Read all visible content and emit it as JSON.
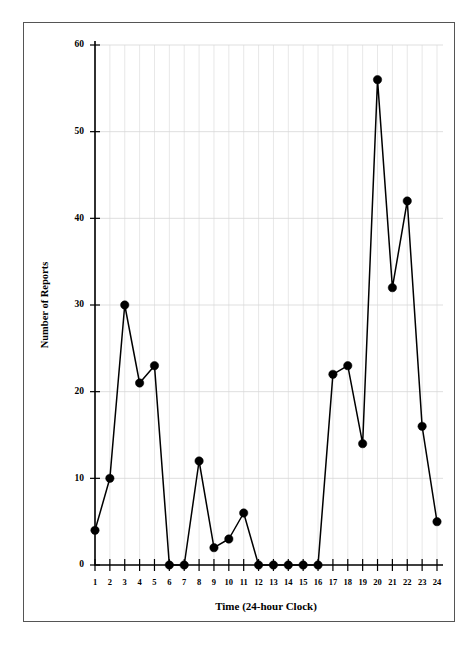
{
  "figure": {
    "background_color": "#ffffff",
    "frame_color": "#555555",
    "has_outer_frame": true
  },
  "chart_data": {
    "type": "line",
    "title": "",
    "subtitle": "",
    "xlabel": "Time (24-hour Clock)",
    "ylabel": "Number of Reports",
    "x": [
      1,
      2,
      3,
      4,
      5,
      6,
      7,
      8,
      9,
      10,
      11,
      12,
      13,
      14,
      15,
      16,
      17,
      18,
      19,
      20,
      21,
      22,
      23,
      24
    ],
    "values": [
      4,
      10,
      30,
      21,
      23,
      0,
      0,
      12,
      2,
      3,
      6,
      0,
      0,
      0,
      0,
      0,
      22,
      23,
      14,
      56,
      32,
      42,
      16,
      5
    ],
    "xtick_labels": [
      "1",
      "2",
      "3",
      "4",
      "5",
      "6",
      "7",
      "8",
      "9",
      "10",
      "11",
      "12",
      "13",
      "14",
      "15",
      "16",
      "17",
      "18",
      "19",
      "20",
      "21",
      "22",
      "23",
      "24"
    ],
    "ytick_labels": [
      "0",
      "10",
      "20",
      "30",
      "40",
      "50",
      "60"
    ],
    "yticks": [
      0,
      10,
      20,
      30,
      40,
      50,
      60
    ],
    "xlim": [
      1,
      24
    ],
    "ylim": [
      0,
      60
    ],
    "grid": true,
    "grid_axes": "both",
    "legend": false,
    "legend_position": "none",
    "marker": "filled-circle",
    "marker_color": "#000000",
    "line_color": "#000000",
    "annotations": []
  },
  "axes": {
    "y_axis_label": "Number of Reports",
    "x_axis_label": "Time (24-hour Clock)"
  }
}
